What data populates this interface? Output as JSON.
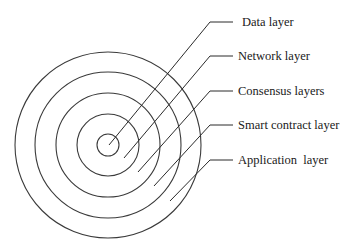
{
  "diagram": {
    "center": [
      108,
      145
    ],
    "ring_color": "#3a3a3a",
    "layers": [
      {
        "label": "Data layer",
        "radius": 11,
        "line_from": [
          109,
          145
        ],
        "elbow": [
          210,
          22
        ],
        "tick_end": 233,
        "label_pos": [
          242,
          15
        ]
      },
      {
        "label": "Network layer",
        "radius": 31,
        "line_from": [
          124,
          158
        ],
        "elbow": [
          210,
          56
        ],
        "tick_end": 233,
        "label_pos": [
          238,
          49
        ]
      },
      {
        "label": "Consensus layers",
        "radius": 52,
        "line_from": [
          138,
          172
        ],
        "elbow": [
          210,
          91
        ],
        "tick_end": 233,
        "label_pos": [
          238,
          84
        ]
      },
      {
        "label": "Smart contract layer",
        "radius": 73,
        "line_from": [
          154,
          186
        ],
        "elbow": [
          210,
          125
        ],
        "tick_end": 233,
        "label_pos": [
          238,
          118
        ]
      },
      {
        "label": "Application  layer",
        "radius": 93,
        "line_from": [
          170,
          201
        ],
        "elbow": [
          210,
          160
        ],
        "tick_end": 233,
        "label_pos": [
          238,
          153
        ]
      }
    ]
  }
}
